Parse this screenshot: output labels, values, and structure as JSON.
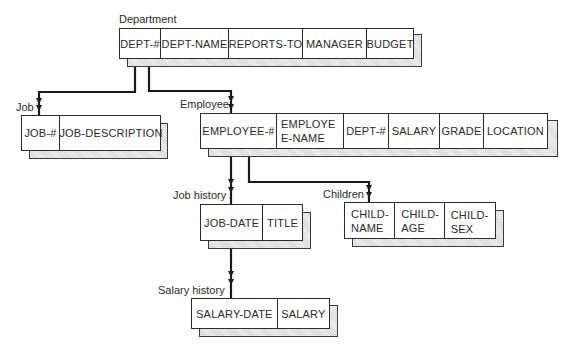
{
  "diagram": {
    "type": "hierarchical-database-schema",
    "colors": {
      "line": "#1a1a1a",
      "box_border": "#2b2b2b",
      "shadow_fill": "#e2e2e2",
      "background": "#ffffff"
    },
    "entities": {
      "department": {
        "label": "Department",
        "fields": [
          "DEPT-#",
          "DEPT-NAME",
          "REPORTS-TO",
          "MANAGER",
          "BUDGET"
        ]
      },
      "job": {
        "label": "Job",
        "fields": [
          "JOB-#",
          "JOB-DESCRIPTION"
        ]
      },
      "employee": {
        "label": "Employee",
        "fields": [
          "EMPLOYEE-#",
          "EMPLOYEE-NAME",
          "DEPT-#",
          "SALARY",
          "GRADE",
          "LOCATION"
        ]
      },
      "job_history": {
        "label": "Job history",
        "fields": [
          "JOB-DATE",
          "TITLE"
        ]
      },
      "children": {
        "label": "Children",
        "fields": [
          "CHILD-NAME",
          "CHILD-AGE",
          "CHILD-SEX"
        ]
      },
      "salary_history": {
        "label": "Salary history",
        "fields": [
          "SALARY-DATE",
          "SALARY"
        ]
      }
    },
    "relationships": [
      {
        "from": "Department",
        "to": "Job",
        "type": "one-to-many"
      },
      {
        "from": "Department",
        "to": "Employee",
        "type": "one-to-many"
      },
      {
        "from": "Employee",
        "to": "Job history",
        "type": "one-to-many"
      },
      {
        "from": "Employee",
        "to": "Children",
        "type": "one-to-many"
      },
      {
        "from": "Job history",
        "to": "Salary history",
        "type": "one-to-many"
      }
    ]
  }
}
